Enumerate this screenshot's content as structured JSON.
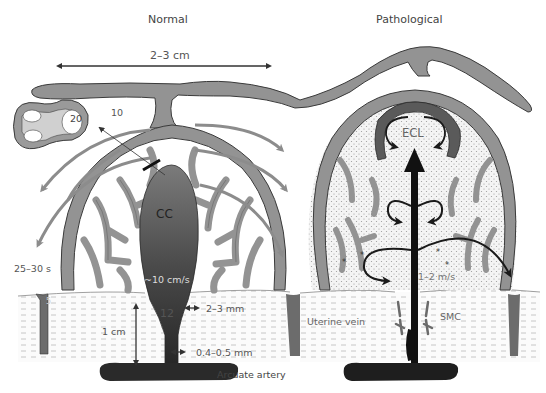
{
  "panels": {
    "normal": {
      "title": "Normal"
    },
    "pathological": {
      "title": "Pathological"
    }
  },
  "labels": {
    "width_span": "2–3 cm",
    "villus_number_20": "20",
    "villus_number_10": "10",
    "central_cavity": "CC",
    "transit_time": "25–30 s",
    "flow_velocity_normal": "~10 cm/s",
    "segment_12": "12",
    "segment_5": "5",
    "depth": "1 cm",
    "artery_diameter_upper": "2–3 mm",
    "artery_diameter_lower": "0.4–0.5 mm",
    "arcuate_artery": "Arcuate artery",
    "echogenic_cystic_lesion": "ECL",
    "flow_velocity_pathological": "1–2 m/s",
    "uterine_vein": "Uterine vein",
    "smooth_muscle_cells": "SMC"
  },
  "colors": {
    "villous_tree": "#8f8f8f",
    "villous_outline": "#3a3a3a",
    "central_cavity_dark": "#2c2c2c",
    "central_cavity_light": "#7a7a7a",
    "flow_arrow_normal": "#8c8c8c",
    "flow_arrow_pathological": "#1a1a1a",
    "myometrium_dash": "#b5b5b5",
    "intervillous_dots": "#bdbdbd",
    "ecl_band": "#5a5a5a"
  }
}
